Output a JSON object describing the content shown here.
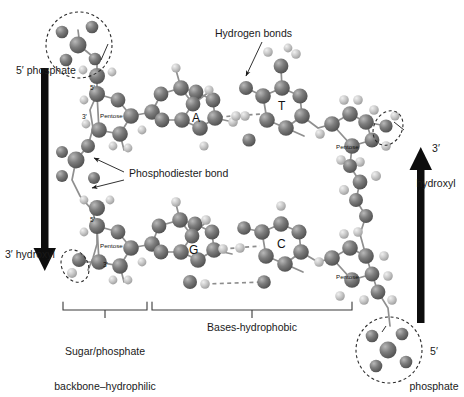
{
  "figure": {
    "background_color": "#ffffff",
    "atom_color_dark": "#6f6f6f",
    "atom_color_light": "#c9c9c9",
    "bond_color": "#8a8a8a",
    "text_color": "#1a1a1a"
  },
  "annotations": {
    "five_prime_phosphate_left": "5′ phosphate",
    "three_prime_hydroxyl_left": "3′ hydroxyl",
    "hydrogen_bonds": "Hydrogen bonds",
    "phosphodiester_bond": "Phosphodiester bond",
    "three_prime_hydroxyl_right_line1": "3′",
    "three_prime_hydroxyl_right_line2": "hydroxyl",
    "five_prime_phosphate_right_line1": "5′",
    "five_prime_phosphate_right_line2": "phosphate"
  },
  "brackets": {
    "sugar_phosphate_line1": "Sugar/phosphate",
    "sugar_phosphate_line2": "backbone–hydrophilic",
    "bases_label": "Bases-hydrophobic"
  },
  "bases": {
    "adenine": "A",
    "thymine": "T",
    "guanine": "G",
    "cytosine": "C"
  },
  "sugars": [
    {
      "name": "Pentose",
      "five": "5′",
      "three": "3′"
    },
    {
      "name": "Pentose",
      "five": "",
      "three": ""
    },
    {
      "name": "Pentose",
      "five": "5′",
      "three": "3′"
    },
    {
      "name": "Pentose",
      "five": "",
      "three": ""
    }
  ],
  "atom_labels": {
    "carbon": "C",
    "nitrogen": "N",
    "oxygen": "O",
    "phosphorus": "P",
    "hydrogen": "H"
  },
  "arrows": {
    "left_direction": "down",
    "right_direction": "up"
  }
}
